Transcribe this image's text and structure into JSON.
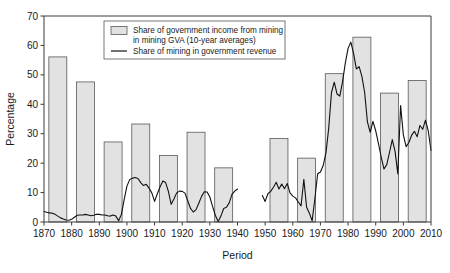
{
  "chart_data": {
    "type": "bar",
    "title": "",
    "xlabel": "Period",
    "ylabel": "Percentage",
    "xlim": [
      1870,
      2010
    ],
    "ylim": [
      0,
      70
    ],
    "ytick_labels": [
      "0",
      "10",
      "20",
      "30",
      "40",
      "50",
      "60",
      "70"
    ],
    "yticks": [
      0,
      10,
      20,
      30,
      40,
      50,
      60,
      70
    ],
    "xtick_labels": [
      "1870",
      "1880",
      "1890",
      "1900",
      "1910",
      "1920",
      "1930",
      "1940",
      "1950",
      "1960",
      "1970",
      "1980",
      "1990",
      "2000",
      "2010"
    ],
    "xticks": [
      1870,
      1880,
      1890,
      1900,
      1910,
      1920,
      1930,
      1940,
      1950,
      1960,
      1970,
      1980,
      1990,
      2000,
      2010
    ],
    "grid": false,
    "legend_position": "top-center",
    "legend": [
      {
        "key": "bars",
        "marker": "filled-rect",
        "label_line1": "Share of government income from mining",
        "label_line2": "in mining GVA (10-year averages)"
      },
      {
        "key": "line",
        "marker": "line",
        "label_line1": "Share of mining in government revenue",
        "label_line2": ""
      }
    ],
    "series": [
      {
        "name": "Share of government income from mining in mining GVA (10-year averages)",
        "type": "bar",
        "bar_width_years": 6.5,
        "categories": [
          "1871-1880",
          "1881-1890",
          "1891-1900",
          "1901-1910",
          "1911-1920",
          "1921-1930",
          "1931-1940",
          "1951-1960",
          "1961-1970",
          "1971-1980",
          "1981-1990",
          "1991-2000",
          "2001-2010"
        ],
        "bar_centers": [
          1875,
          1885,
          1895,
          1905,
          1915,
          1925,
          1935,
          1955,
          1965,
          1975,
          1985,
          1995,
          2005
        ],
        "values": [
          56.1,
          47.6,
          27.2,
          33.3,
          22.6,
          30.5,
          18.4,
          28.4,
          21.7,
          50.4,
          62.8,
          43.8,
          48.1
        ]
      },
      {
        "name": "Share of mining in government revenue",
        "type": "line",
        "segments": [
          {
            "x": [
              1870,
              1871,
              1872,
              1873,
              1874,
              1875,
              1876,
              1877,
              1878,
              1879,
              1880,
              1881,
              1882,
              1883,
              1884,
              1885,
              1886,
              1887,
              1888,
              1889,
              1890,
              1891,
              1892,
              1893,
              1894,
              1895,
              1896,
              1897,
              1898,
              1899,
              1900,
              1901,
              1902,
              1903,
              1904,
              1905,
              1906,
              1907,
              1908,
              1909,
              1910,
              1911,
              1912,
              1913,
              1914,
              1915,
              1916,
              1917,
              1918,
              1919,
              1920,
              1921,
              1922,
              1923,
              1924,
              1925,
              1926,
              1927,
              1928,
              1929,
              1930,
              1931,
              1932,
              1933,
              1934,
              1935,
              1936,
              1937,
              1938,
              1939,
              1940
            ],
            "y": [
              3.6,
              3.3,
              3.1,
              3.0,
              2.6,
              2.0,
              1.4,
              1.0,
              0.7,
              0.6,
              0.9,
              1.6,
              2.3,
              2.4,
              2.4,
              2.6,
              2.4,
              2.1,
              2.3,
              2.6,
              2.6,
              2.4,
              2.4,
              2.1,
              2.0,
              2.4,
              2.0,
              0.4,
              2.6,
              7.6,
              12.2,
              14.4,
              14.9,
              15.1,
              14.8,
              13.4,
              12.4,
              12.8,
              11.5,
              9.9,
              7.0,
              9.6,
              12.0,
              13.9,
              13.4,
              10.4,
              6.0,
              7.8,
              9.9,
              10.5,
              10.4,
              9.8,
              7.2,
              4.6,
              3.4,
              4.2,
              6.4,
              8.7,
              10.3,
              10.2,
              8.5,
              5.2,
              2.2,
              0.2,
              2.0,
              4.6,
              5.0,
              6.5,
              9.4,
              10.5,
              11.2
            ]
          },
          {
            "x": [
              1949,
              1950,
              1951,
              1952,
              1953,
              1954,
              1955,
              1956,
              1957,
              1958,
              1959,
              1960,
              1961,
              1962,
              1963,
              1964,
              1965,
              1966,
              1967,
              1968,
              1969,
              1970,
              1971,
              1972,
              1973,
              1974,
              1975,
              1976,
              1977,
              1978,
              1979,
              1980,
              1981,
              1982,
              1983,
              1984,
              1985,
              1986,
              1987,
              1988,
              1989,
              1990,
              1991,
              1992,
              1993,
              1994,
              1995,
              1996,
              1997,
              1998,
              1999,
              2000,
              2001,
              2002,
              2003,
              2004,
              2005,
              2006,
              2007,
              2008,
              2009,
              2010
            ],
            "y": [
              9.0,
              7.0,
              9.6,
              10.4,
              11.8,
              13.5,
              11.2,
              12.9,
              11.3,
              13.1,
              9.9,
              8.8,
              8.2,
              6.8,
              5.5,
              14.5,
              5.0,
              3.0,
              0.4,
              8.0,
              16.4,
              17.0,
              19.2,
              23.5,
              31.9,
              44.0,
              47.5,
              43.5,
              42.8,
              47.6,
              54.0,
              59.0,
              61.1,
              57.2,
              52.0,
              52.8,
              49.5,
              44.0,
              34.0,
              30.5,
              34.2,
              31.0,
              26.6,
              22.0,
              18.0,
              19.5,
              23.7,
              28.0,
              24.0,
              16.3,
              39.6,
              29.6,
              25.6,
              27.0,
              29.5,
              30.8,
              29.0,
              32.8,
              31.5,
              34.6,
              31.0,
              24.3
            ]
          }
        ]
      }
    ]
  }
}
